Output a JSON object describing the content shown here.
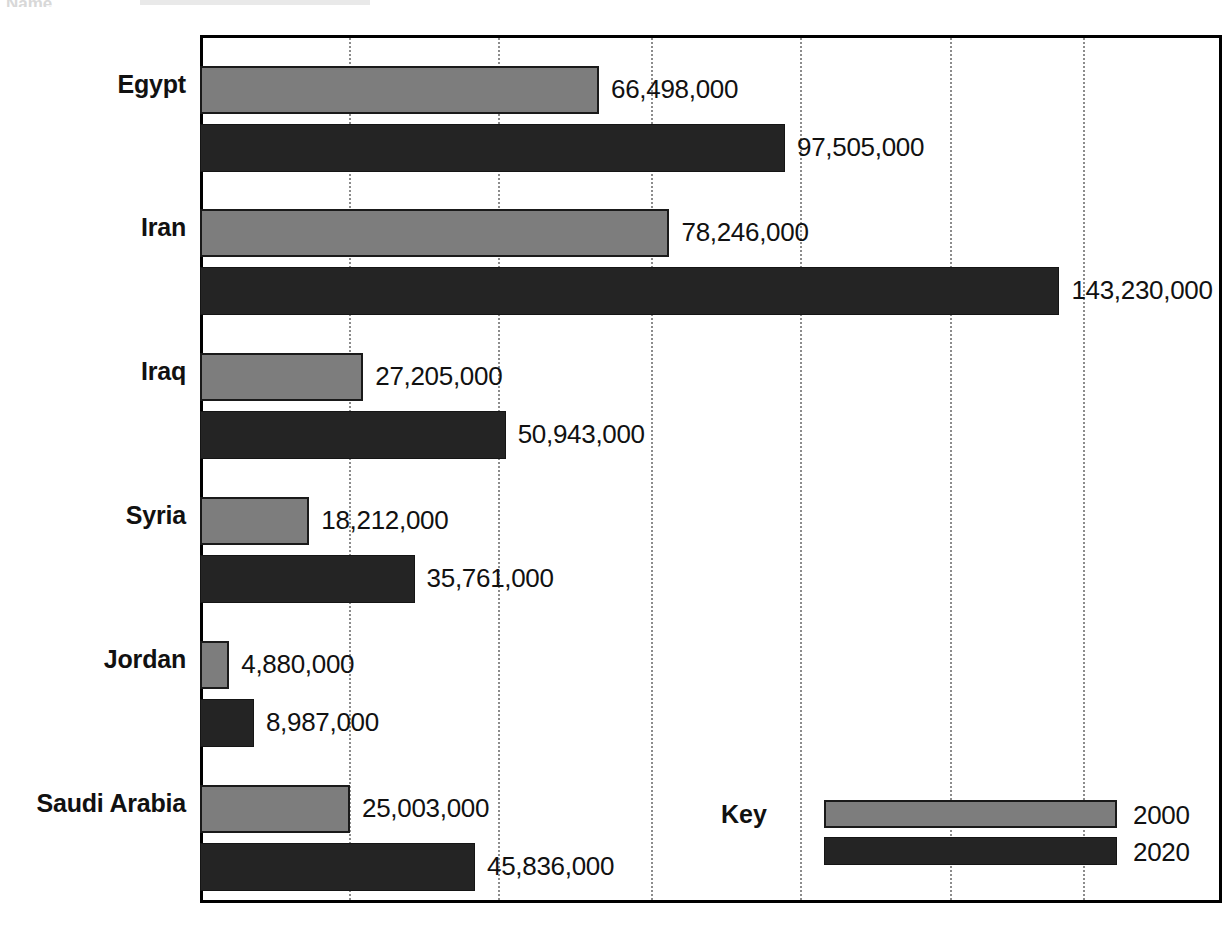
{
  "page": {
    "cut_off_header_fragment": "Name",
    "background_color": "#ffffff"
  },
  "legend": {
    "title": "Key",
    "entries": [
      {
        "label": "2000",
        "color": "#7d7d7d"
      },
      {
        "label": "2020",
        "color": "#242424"
      }
    ]
  },
  "axis": {
    "gridline_positions_px": [
      349,
      498,
      651,
      800,
      950,
      1083
    ],
    "plot_left_px": 200,
    "plot_right_px": 1222,
    "units_per_gridline": 25000000
  },
  "chart_data": {
    "type": "bar",
    "orientation": "horizontal",
    "title": "",
    "subtitle": "",
    "xlabel": "",
    "ylabel": "",
    "grid": true,
    "legend_position": "bottom-right",
    "xlim": [
      0,
      171500000
    ],
    "categories": [
      "Egypt",
      "Iran",
      "Iraq",
      "Syria",
      "Jordan",
      "Saudi Arabia"
    ],
    "series": [
      {
        "name": "2000",
        "color": "#7d7d7d",
        "values": [
          66498000,
          78246000,
          27205000,
          18212000,
          4880000,
          25003000
        ],
        "labels": [
          "66,498,000",
          "78,246,000",
          "27,205,000",
          "18,212,000",
          "4,880,000",
          "25,003,000"
        ]
      },
      {
        "name": "2020",
        "color": "#242424",
        "values": [
          97505000,
          143230000,
          50943000,
          35761000,
          8987000,
          45836000
        ],
        "labels": [
          "97,505,000",
          "143,230,000",
          "50,943,000",
          "35,761,000",
          "8,987,000",
          "45,836,000"
        ]
      }
    ]
  },
  "rows": [
    {
      "country": "Egypt",
      "label_top": 70,
      "bar2000": {
        "top": 66,
        "height": 48,
        "value": 66498000,
        "label": "66,498,000"
      },
      "bar2020": {
        "top": 124,
        "height": 48,
        "value": 97505000,
        "label": "97,505,000"
      }
    },
    {
      "country": "Iran",
      "label_top": 213,
      "bar2000": {
        "top": 209,
        "height": 48,
        "value": 78246000,
        "label": "78,246,000"
      },
      "bar2020": {
        "top": 267,
        "height": 48,
        "value": 143230000,
        "label": "143,230,000"
      }
    },
    {
      "country": "Iraq",
      "label_top": 357,
      "bar2000": {
        "top": 353,
        "height": 48,
        "value": 27205000,
        "label": "27,205,000"
      },
      "bar2020": {
        "top": 411,
        "height": 48,
        "value": 50943000,
        "label": "50,943,000"
      }
    },
    {
      "country": "Syria",
      "label_top": 501,
      "bar2000": {
        "top": 497,
        "height": 48,
        "value": 18212000,
        "label": "18,212,000"
      },
      "bar2020": {
        "top": 555,
        "height": 48,
        "value": 35761000,
        "label": "35,761,000"
      }
    },
    {
      "country": "Jordan",
      "label_top": 645,
      "bar2000": {
        "top": 641,
        "height": 48,
        "value": 4880000,
        "label": "4,880,000"
      },
      "bar2020": {
        "top": 699,
        "height": 48,
        "value": 8987000,
        "label": "8,987,000"
      }
    },
    {
      "country": "Saudi Arabia",
      "label_top": 789,
      "bar2000": {
        "top": 785,
        "height": 48,
        "value": 25003000,
        "label": "25,003,000"
      },
      "bar2020": {
        "top": 843,
        "height": 48,
        "value": 45836000,
        "label": "45,836,000"
      }
    }
  ]
}
